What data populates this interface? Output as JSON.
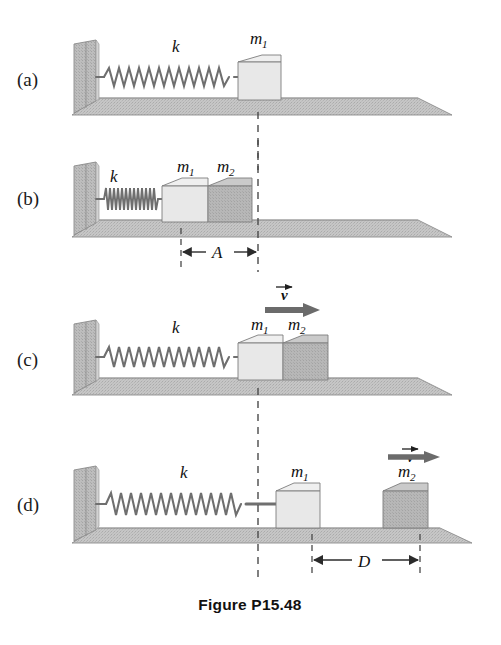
{
  "figure": {
    "caption": "Figure P15.48",
    "width": 501,
    "height": 645,
    "background": "#ffffff"
  },
  "colors": {
    "wall_face": "#b9b9b9",
    "wall_side": "#cfcfcf",
    "floor_top": "#c9c9c9",
    "floor_front": "#bdbdbd",
    "block_m1_front": "#e8e8e8",
    "block_m1_top": "#efefef",
    "block_m1_side": "#dcdcdc",
    "block_m2_front": "#b5b5b5",
    "block_m2_top": "#cacaca",
    "block_m2_side": "#a8a8a8",
    "spring": "#6f6f6f",
    "outline": "#5a5a5a",
    "dashed": "#4a4a4a",
    "arrow": "#6b6b6b",
    "text": "#111111"
  },
  "panels": [
    {
      "id": "a",
      "label": "(a)",
      "description": "spring relaxed, block m1 resting against free end of spring",
      "spring_label": "k",
      "blocks": [
        {
          "name": "m1",
          "base": "m",
          "sub": "1",
          "shade": "light"
        }
      ],
      "velocity": null,
      "dimension": null
    },
    {
      "id": "b",
      "label": "(b)",
      "description": "spring compressed by amount A, blocks m1 and m2 together",
      "spring_label": "k",
      "blocks": [
        {
          "name": "m1",
          "base": "m",
          "sub": "1",
          "shade": "light"
        },
        {
          "name": "m2",
          "base": "m",
          "sub": "2",
          "shade": "dark"
        }
      ],
      "velocity": null,
      "dimension": {
        "symbol": "A",
        "base": "A",
        "sub": ""
      }
    },
    {
      "id": "c",
      "label": "(c)",
      "description": "spring returned to natural length, blocks moving right with velocity v",
      "spring_label": "k",
      "blocks": [
        {
          "name": "m1",
          "base": "m",
          "sub": "1",
          "shade": "light"
        },
        {
          "name": "m2",
          "base": "m",
          "sub": "2",
          "shade": "dark"
        }
      ],
      "velocity": {
        "base": "v",
        "sub": ""
      },
      "dimension": null
    },
    {
      "id": "d",
      "label": "(d)",
      "description": "spring stretched attached to m1, block m2 separated by distance D moving right",
      "spring_label": "k",
      "blocks": [
        {
          "name": "m1",
          "base": "m",
          "sub": "1",
          "shade": "light"
        },
        {
          "name": "m2",
          "base": "m",
          "sub": "2",
          "shade": "dark"
        }
      ],
      "velocity": {
        "base": "v",
        "sub": ""
      },
      "dimension": {
        "symbol": "D",
        "base": "D",
        "sub": ""
      }
    }
  ]
}
